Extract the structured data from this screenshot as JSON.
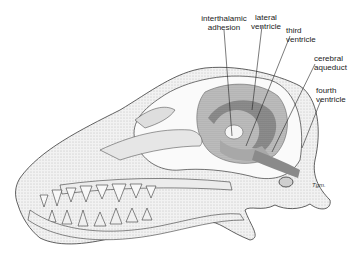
{
  "figure": {
    "colors": {
      "line": "#3a3a3a",
      "stipple_light": "#d9d9d9",
      "stipple_mid": "#bdbdbd",
      "ventricle_dark": "#8a8a8a"
    }
  },
  "labels": [
    {
      "id": "interthalamic-adhesion",
      "line1": "interthalamic",
      "line2": "adhesion"
    },
    {
      "id": "lateral-ventricle",
      "line1": "lateral",
      "line2": "ventricle"
    },
    {
      "id": "third-ventricle",
      "line1": "third",
      "line2": "ventricle"
    },
    {
      "id": "cerebral-aqueduct",
      "line1": "cerebral",
      "line2": "aqueduct"
    },
    {
      "id": "fourth-ventricle",
      "line1": "fourth",
      "line2": "ventricle"
    }
  ],
  "signature": "Tgm."
}
